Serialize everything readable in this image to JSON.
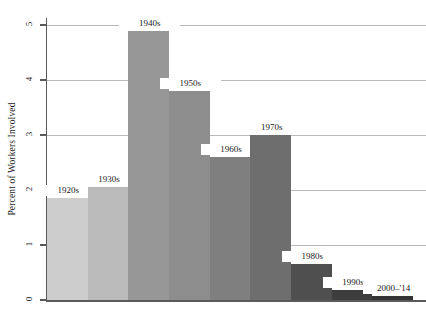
{
  "chart_data": {
    "type": "bar",
    "title": "",
    "subtitle": "",
    "xlabel": "",
    "ylabel": "Percent of Workers Involved",
    "ylim": [
      0,
      5
    ],
    "xlim": [
      0,
      9
    ],
    "grid": true,
    "legend": "none",
    "orientation": "vertical",
    "y_ticks": [
      "0",
      "1",
      "2",
      "3",
      "4",
      "5"
    ],
    "y_tick_values": [
      0,
      1,
      2,
      3,
      4,
      5
    ],
    "categories": [
      "1920s",
      "1930s",
      "1940s",
      "1950s",
      "1960s",
      "1970s",
      "1980s",
      "1990s",
      "2000–'14"
    ],
    "values": [
      1.85,
      2.05,
      4.9,
      3.8,
      2.6,
      3.0,
      0.65,
      0.18,
      0.08
    ],
    "bar_colors": [
      "#cdcdcd",
      "#bababa",
      "#979797",
      "#8d8d8d",
      "#7f7f7f",
      "#6e6e6e",
      "#4f4f4f",
      "#3d3d3d",
      "#333333"
    ],
    "bars": [
      {
        "label": "1920s",
        "value": 1.85,
        "color": "#cdcdcd"
      },
      {
        "label": "1930s",
        "value": 2.05,
        "color": "#bababa"
      },
      {
        "label": "1940s",
        "value": 4.9,
        "color": "#979797"
      },
      {
        "label": "1950s",
        "value": 3.8,
        "color": "#8d8d8d"
      },
      {
        "label": "1960s",
        "value": 2.6,
        "color": "#7f7f7f"
      },
      {
        "label": "1970s",
        "value": 3.0,
        "color": "#6e6e6e"
      },
      {
        "label": "1980s",
        "value": 0.65,
        "color": "#4f4f4f"
      },
      {
        "label": "1990s",
        "value": 0.18,
        "color": "#3d3d3d"
      },
      {
        "label": "2000–'14",
        "value": 0.08,
        "color": "#333333"
      }
    ]
  },
  "axis": {
    "y_title": "Percent of Workers Involved",
    "ticks": [
      {
        "label": "0",
        "value": 0
      },
      {
        "label": "1",
        "value": 1
      },
      {
        "label": "2",
        "value": 2
      },
      {
        "label": "3",
        "value": 3
      },
      {
        "label": "4",
        "value": 4
      },
      {
        "label": "5",
        "value": 5
      }
    ]
  },
  "style": {
    "axis_color": "#5a5a5a",
    "grid_color": "#b9b9b9",
    "text_color": "#1a1a1a",
    "background": "#ffffff"
  }
}
